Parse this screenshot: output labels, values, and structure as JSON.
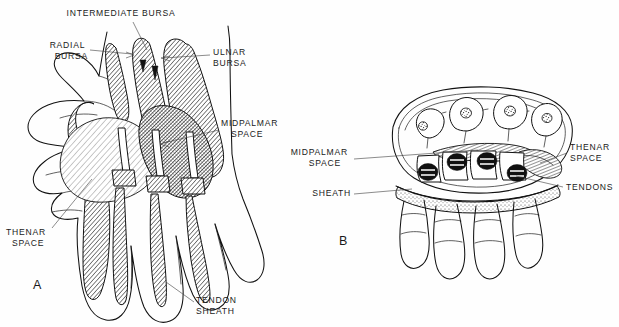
{
  "figure": {
    "background_color": "#fefefe",
    "ink_color": "#111111",
    "width": 619,
    "height": 327
  },
  "panels": [
    {
      "id": "A",
      "letter": "A",
      "view": "palmar-view-of-hand",
      "labels": [
        {
          "key": "intermediate_bursa",
          "text": "INTERMEDIATE BURSA",
          "lines": [
            "INTERMEDIATE BURSA"
          ],
          "anchor": "middle",
          "x": 121,
          "y": 16
        },
        {
          "key": "radial_bursa",
          "text": "RADIAL BURSA",
          "lines": [
            "RADIAL",
            "BURSA"
          ],
          "anchor": "end",
          "x": 88,
          "y": 48
        },
        {
          "key": "ulnar_bursa",
          "text": "ULNAR BURSA",
          "lines": [
            "ULNAR",
            "BURSA"
          ],
          "anchor": "start",
          "x": 213,
          "y": 55
        },
        {
          "key": "midpalmar_space",
          "text": "MIDPALMAR SPACE",
          "lines": [
            "MIDPALMAR",
            "SPACE"
          ],
          "anchor": "start",
          "x": 221,
          "y": 126
        },
        {
          "key": "thenar_space",
          "text": "THENAR SPACE",
          "lines": [
            "THENAR",
            "SPACE"
          ],
          "anchor": "start",
          "x": 6,
          "y": 235
        },
        {
          "key": "tendon_sheath",
          "text": "TENDON SHEATH",
          "lines": [
            "TENDON",
            "SHEATH"
          ],
          "anchor": "start",
          "x": 196,
          "y": 303
        }
      ]
    },
    {
      "id": "B",
      "letter": "B",
      "view": "cross-section-through-palm",
      "labels": [
        {
          "key": "midpalmar_space",
          "text": "MIDPALMAR SPACE",
          "lines": [
            "MIDPALMAR",
            "SPACE"
          ],
          "anchor": "end",
          "x": 351,
          "y": 155
        },
        {
          "key": "sheath",
          "text": "SHEATH",
          "lines": [
            "SHEATH"
          ],
          "anchor": "end",
          "x": 351,
          "y": 196
        },
        {
          "key": "thenar_space",
          "text": "THENAR SPACE",
          "lines": [
            "THENAR",
            "SPACE"
          ],
          "anchor": "start",
          "x": 570,
          "y": 150
        },
        {
          "key": "tendons",
          "text": "TENDONS",
          "lines": [
            "TENDONS"
          ],
          "anchor": "start",
          "x": 566,
          "y": 190
        }
      ],
      "structures": {
        "metacarpal_count": 4,
        "tendon_group_count": 4
      }
    }
  ]
}
